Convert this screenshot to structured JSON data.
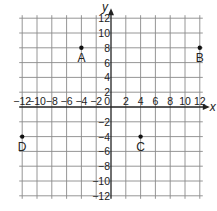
{
  "chart_data": {
    "type": "scatter",
    "title": "",
    "xlabel": "x",
    "ylabel": "y",
    "xlim": [
      -12,
      12
    ],
    "ylim": [
      -12,
      12
    ],
    "grid": true,
    "grid_step": 2,
    "x_ticks": [
      -12,
      -10,
      -8,
      -6,
      -4,
      -2,
      0,
      2,
      4,
      6,
      8,
      10,
      12
    ],
    "y_ticks": [
      -12,
      -10,
      -8,
      -6,
      -4,
      -2,
      2,
      4,
      6,
      8,
      10,
      12
    ],
    "points": [
      {
        "label": "A",
        "x": -4,
        "y": 8
      },
      {
        "label": "B",
        "x": 12,
        "y": 8
      },
      {
        "label": "C",
        "x": 4,
        "y": -4
      },
      {
        "label": "D",
        "x": -12,
        "y": -4
      }
    ]
  },
  "colors": {
    "grid": "#8a8a8a",
    "axis": "#222222",
    "point": "#111111",
    "background": "#ffffff"
  }
}
